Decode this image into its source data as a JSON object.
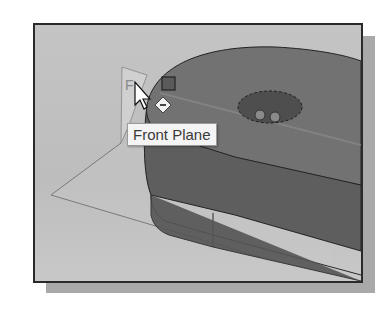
{
  "viewport": {
    "tooltip": "Front Plane",
    "plane_label_partial": "F"
  },
  "colors": {
    "background": "#c0c0c0",
    "part": "#6e6e6e",
    "tooltip_bg": "#f4f4f4"
  }
}
